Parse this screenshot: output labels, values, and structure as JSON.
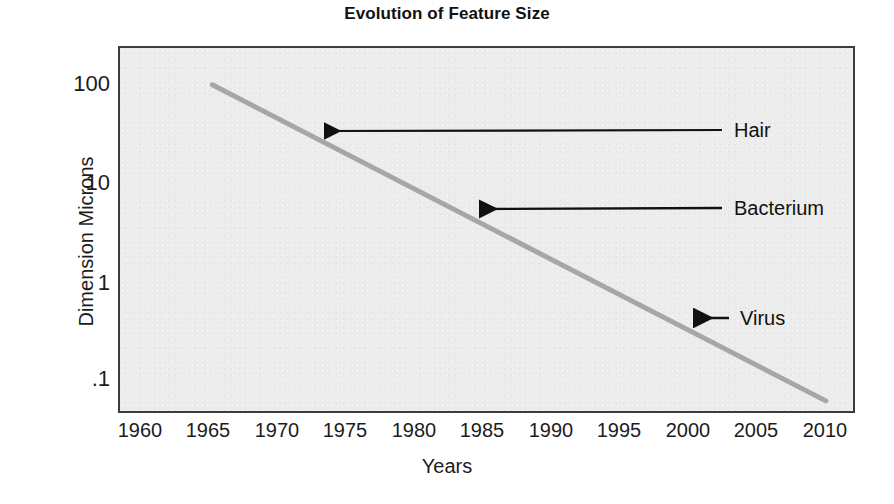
{
  "chart_data": {
    "type": "line",
    "title": "Evolution of Feature Size",
    "xlabel": "Years",
    "ylabel": "Dimension Microns",
    "yscale": "log",
    "xlim": [
      1958,
      2012
    ],
    "ylim": [
      0.06,
      180
    ],
    "grid": false,
    "legend": "none",
    "x_ticks": [
      "1960",
      "1965",
      "1970",
      "1975",
      "1980",
      "1985",
      "1990",
      "1995",
      "2000",
      "2005",
      "2010"
    ],
    "x_tick_values": [
      1960,
      1965,
      1970,
      1975,
      1980,
      1985,
      1990,
      1995,
      2000,
      2005,
      2010
    ],
    "y_ticks": [
      "100",
      "10",
      "1",
      ".1"
    ],
    "y_tick_values": [
      100,
      10,
      1,
      0.1
    ],
    "series": [
      {
        "name": "Feature size",
        "color": "#a6a6a6",
        "x": [
          1964.8,
          2010.0
        ],
        "y": [
          80,
          0.075
        ],
        "points": [
          {
            "x": 1964.8,
            "y": 80
          },
          {
            "x": 1970,
            "y": 35
          },
          {
            "x": 1975,
            "y": 16
          },
          {
            "x": 1980,
            "y": 7.3
          },
          {
            "x": 1985,
            "y": 3.3
          },
          {
            "x": 1990,
            "y": 1.5
          },
          {
            "x": 1995,
            "y": 0.68
          },
          {
            "x": 2000,
            "y": 0.31
          },
          {
            "x": 2005,
            "y": 0.14
          },
          {
            "x": 2010,
            "y": 0.075
          }
        ]
      }
    ],
    "annotations": [
      {
        "label": "Hair",
        "arrow_tip_x": 320,
        "arrow_tip_y": 131,
        "arrow_tail_x": 722,
        "arrow_tail_y": 130,
        "label_x": 734,
        "label_y": 130,
        "points_to_value": "~40 microns near 1972"
      },
      {
        "label": "Bacterium",
        "arrow_tip_x": 475,
        "arrow_tip_y": 209,
        "arrow_tail_x": 722,
        "arrow_tail_y": 208,
        "label_x": 734,
        "label_y": 208,
        "points_to_value": "~5 microns near 1984"
      },
      {
        "label": "Virus",
        "arrow_tip_x": 688,
        "arrow_tip_y": 318,
        "arrow_tail_x": 729,
        "arrow_tail_y": 318,
        "label_x": 740,
        "label_y": 318,
        "points_to_value": "~0.35 microns near 2000"
      }
    ]
  },
  "colors": {
    "plot_background": "#ececec",
    "plot_border": "#3d3d3d",
    "line": "#a6a6a6",
    "text": "#1c1c1c",
    "page_background": "#ffffff"
  }
}
